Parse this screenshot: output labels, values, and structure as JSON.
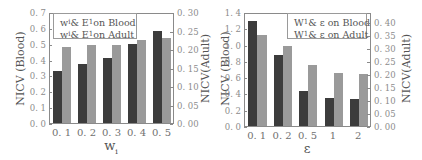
{
  "chart_data": [
    {
      "type": "bar",
      "title": "",
      "xlabel": "w_i",
      "ylabel": "NICV (Blood)",
      "ylabel_right": "NICV(Adult)",
      "categories": [
        "0. 1",
        "0. 2",
        "0. 3",
        "0. 4",
        "0. 5"
      ],
      "ylim": [
        0,
        0.7
      ],
      "ylim_right": [
        0,
        0.3
      ],
      "yticks": [
        "0. 0",
        "0. 1",
        "0. 2",
        "0. 3",
        "0. 4",
        "0. 5",
        "0. 6",
        "0. 7"
      ],
      "yticks_right": [
        "0. 00",
        "0. 05",
        "0. 10",
        "0. 15",
        "0. 20",
        "0. 25",
        "0. 30"
      ],
      "legend_position": "upper left",
      "series": [
        {
          "name": "w_i & E_1 on Blood",
          "axis": "left",
          "color": "#3c3c3c",
          "values": [
            0.33,
            0.37,
            0.41,
            0.5,
            0.58
          ]
        },
        {
          "name": "w_i & E_1 on Adult",
          "axis": "right",
          "color": "#9a9a9a",
          "values": [
            0.205,
            0.21,
            0.21,
            0.225,
            0.23
          ]
        }
      ]
    },
    {
      "type": "bar",
      "title": "",
      "xlabel": "ε",
      "ylabel": "NICV (Blood)",
      "ylabel_right": "NICV(Adult)",
      "categories": [
        "0. 1",
        "0. 2",
        "0. 5",
        "1",
        "2"
      ],
      "ylim": [
        0,
        1.4
      ],
      "ylim_right": [
        0,
        0.44
      ],
      "yticks": [
        "0. 0",
        "0. 2",
        "0. 4",
        "0. 6",
        "0. 8",
        "1. 0",
        "1. 2",
        "1. 4"
      ],
      "yticks_right": [
        "0. 00",
        "0. 05",
        "0. 10",
        "0. 15",
        "0. 20",
        "0. 25",
        "0. 30",
        "0. 35",
        "0. 40"
      ],
      "legend_position": "upper right",
      "series": [
        {
          "name": "W_1 & ε on Blood",
          "axis": "left",
          "color": "#3c3c3c",
          "values": [
            1.29,
            0.87,
            0.43,
            0.35,
            0.33
          ]
        },
        {
          "name": "W_1 & ε on Adult",
          "axis": "right",
          "color": "#9a9a9a",
          "values": [
            0.35,
            0.31,
            0.235,
            0.205,
            0.2
          ]
        }
      ]
    }
  ],
  "left_panel": {
    "ylabel": "NICV (Blood)",
    "ylabel_right": "NICV(Adult)",
    "xlabel_main": "w",
    "xlabel_sub": "i",
    "legend": [
      {
        "main": "w",
        "sub": "i",
        "rest": " & E",
        "sub2": "1",
        "tail": " on Blood"
      },
      {
        "main": "w",
        "sub": "i",
        "rest": " & E",
        "sub2": "1",
        "tail": " on Adult"
      }
    ]
  },
  "right_panel": {
    "ylabel": "NICV (Blood)",
    "ylabel_right": "NICV(Adult)",
    "xlabel_main": "ε",
    "legend": [
      {
        "main": "W",
        "sub": "1",
        "tail": "& ε on Blood"
      },
      {
        "main": "W",
        "sub": "1",
        "tail": "& ε on Adult"
      }
    ]
  }
}
